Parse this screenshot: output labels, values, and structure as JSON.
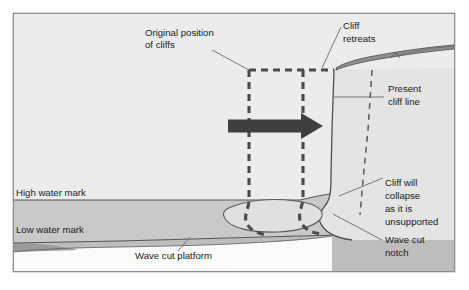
{
  "diagram": {
    "frame": {
      "x": 13,
      "y": 13,
      "width": 442,
      "height": 259,
      "border_color": "#8c8c8c",
      "background": "#f0f0f0"
    },
    "colors": {
      "land_above_hwm": "#ececec",
      "inter_tidal_band": "#c9c9c9",
      "below_lwm_band": "#bdbdbd",
      "platform_surface": "#ffffff",
      "cliff_face": "#e6e6e6",
      "cliff_top_debris": "#8f8f8f",
      "arrow": "#3f3f3f",
      "dashed_line": "#4a4a4a",
      "outline": "#555555",
      "text": "#1a1a1a"
    },
    "labels": [
      {
        "id": "original-position-of-cliffs",
        "lines": [
          "Original position",
          "of cliffs"
        ],
        "x": 145,
        "y": 36
      },
      {
        "id": "cliff-retreats",
        "lines": [
          "Cliff",
          "retreats"
        ],
        "x": 343,
        "y": 29
      },
      {
        "id": "present-cliff-line",
        "lines": [
          "Present",
          "cliff line"
        ],
        "x": 388,
        "y": 92
      },
      {
        "id": "cliff-will-collapse",
        "lines": [
          "Cliff will",
          "collapse",
          "as it is",
          "unsupported"
        ],
        "x": 385,
        "y": 186
      },
      {
        "id": "wave-cut-notch",
        "lines": [
          "Wave cut",
          "notch"
        ],
        "x": 385,
        "y": 243
      },
      {
        "id": "high-water-mark",
        "lines": [
          "High water mark"
        ],
        "x": 16,
        "y": 196
      },
      {
        "id": "low-water-mark",
        "lines": [
          "Low water mark"
        ],
        "x": 16,
        "y": 233
      },
      {
        "id": "wave-cut-platform",
        "lines": [
          "Wave cut platform"
        ],
        "x": 135,
        "y": 259
      }
    ],
    "arrow": {
      "id": "erosion-direction-arrow",
      "from_x": 228,
      "to_x": 323,
      "y": 126,
      "shaft_thickness": 13,
      "head_width": 22,
      "head_height": 27
    },
    "water_levels": {
      "high_water_mark_y": 200,
      "low_water_mark_y": 237
    },
    "dashed_former_cliffs": [
      {
        "id": "former-cliff-line-1",
        "top_x": 249,
        "bottom_x": 249
      },
      {
        "id": "former-cliff-line-2",
        "top_x": 303,
        "bottom_x": 303
      }
    ],
    "collapse_plane": {
      "id": "future-collapse-dashed-line",
      "top_x": 372,
      "top_y": 70,
      "bottom_x": 360,
      "bottom_y": 215
    }
  }
}
